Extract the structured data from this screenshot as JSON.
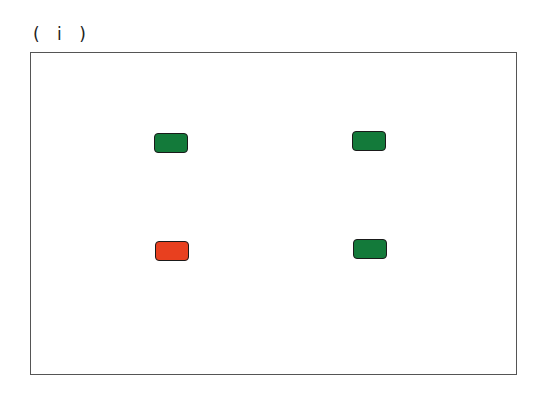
{
  "panel_label": "( i )",
  "frame": {
    "left": 30,
    "top": 52,
    "width": 487,
    "height": 323
  },
  "indicators": [
    {
      "id": "top-left",
      "state": "green",
      "color": "#137a3a",
      "left": 154,
      "top": 133
    },
    {
      "id": "top-right",
      "state": "green",
      "color": "#137a3a",
      "left": 352,
      "top": 131
    },
    {
      "id": "bottom-left",
      "state": "red",
      "color": "#e8401f",
      "left": 155,
      "top": 241
    },
    {
      "id": "bottom-right",
      "state": "green",
      "color": "#137a3a",
      "left": 353,
      "top": 239
    }
  ]
}
